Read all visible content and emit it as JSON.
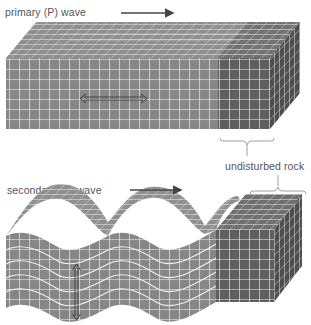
{
  "labels": {
    "p_wave": "primary (P) wave",
    "s_wave": "secondary (S) wave",
    "undisturbed": "undisturbed rock"
  },
  "colors": {
    "rock_light": "#8a8a8a",
    "rock_dark": "#5a5a5a",
    "rock_top": "#9a9a9a",
    "grid_line": "#f4f4f4",
    "arrow": "#444444",
    "label_text": "#555555"
  },
  "p_block": {
    "direction_arrow": "right",
    "particle_motion": "horizontal (back and forth along propagation)"
  },
  "s_block": {
    "direction_arrow": "right",
    "particle_motion": "vertical (perpendicular to propagation)"
  }
}
